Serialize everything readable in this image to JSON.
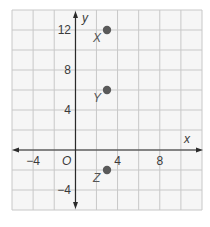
{
  "chart_data": {
    "type": "scatter",
    "title": "",
    "xlabel": "x",
    "ylabel": "y",
    "xlim": [
      -6,
      12
    ],
    "ylim": [
      -6,
      14
    ],
    "grid": true,
    "grid_step": 2,
    "origin_label": "O",
    "x_ticks": [
      {
        "value": -4,
        "label": "−4"
      },
      {
        "value": 4,
        "label": "4"
      },
      {
        "value": 8,
        "label": "8"
      }
    ],
    "y_ticks": [
      {
        "value": 12,
        "label": "12"
      },
      {
        "value": 8,
        "label": "8"
      },
      {
        "value": 4,
        "label": "4"
      },
      {
        "value": -4,
        "label": "−4"
      }
    ],
    "points": [
      {
        "label": "X",
        "x": 3,
        "y": 12
      },
      {
        "label": "Y",
        "x": 3,
        "y": 6
      },
      {
        "label": "Z",
        "x": 3,
        "y": -2
      }
    ],
    "colors": {
      "grid": "#c8c8c8",
      "grid_bg": "#f6f6f6",
      "axis": "#2a2a2a",
      "point": "#5a5a5a"
    }
  }
}
